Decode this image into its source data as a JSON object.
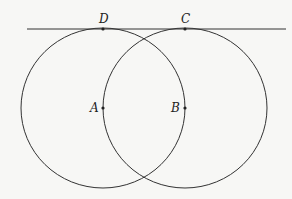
{
  "diagram": {
    "colors": {
      "stroke": "#333333",
      "background": "#f7f7f5"
    },
    "line": {
      "x1": 27,
      "y1": 29,
      "x2": 286,
      "y2": 29
    },
    "circles": [
      {
        "name": "circle-a",
        "cx": 103,
        "cy": 108,
        "rx": 82,
        "ry": 80
      },
      {
        "name": "circle-b",
        "cx": 185,
        "cy": 108,
        "rx": 82,
        "ry": 80
      }
    ],
    "points": [
      {
        "label": "D",
        "x": 103,
        "y": 29,
        "lx": 100,
        "ly": 22
      },
      {
        "label": "C",
        "x": 185,
        "y": 29,
        "lx": 181,
        "ly": 22
      },
      {
        "label": "A",
        "x": 103,
        "y": 108,
        "lx": 90,
        "ly": 112
      },
      {
        "label": "B",
        "x": 185,
        "y": 108,
        "lx": 172,
        "ly": 112
      }
    ]
  }
}
